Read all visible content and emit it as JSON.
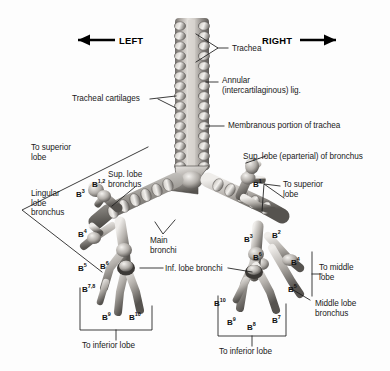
{
  "figure": {
    "orientation": {
      "left_label": "LEFT",
      "left_icon": "arrow-left-icon",
      "right_label": "RIGHT",
      "right_icon": "arrow-right-icon"
    },
    "colors": {
      "background": "#fdfdfd",
      "line": "#1a1a1a",
      "specimen_light": "#e9e7e4",
      "specimen_mid": "#a9a5a1",
      "specimen_dark": "#4e4b48",
      "text": "#1a1a1a"
    },
    "labels": [
      {
        "id": "trachea",
        "text": "Trachea"
      },
      {
        "id": "annular-lig",
        "text": "Annular\n(intercartilaginous) lig."
      },
      {
        "id": "tracheal-cartilages",
        "text": "Tracheal cartilages"
      },
      {
        "id": "membranous-portion",
        "text": "Membranous portion of trachea"
      },
      {
        "id": "sup-lobe-eparterial",
        "text": "Sup. lobe (eparterial) of bronchus"
      },
      {
        "id": "to-superior-lobe-left",
        "text": "To superior\nlobe"
      },
      {
        "id": "lingular-lobe-bronchus",
        "text": "Lingular\nlobe\nbronchus"
      },
      {
        "id": "sup-lobe-bronchus",
        "text": "Sup. lobe\nbronchus"
      },
      {
        "id": "main-bronchi",
        "text": "Main\nbronchi"
      },
      {
        "id": "inf-lobe-bronchi",
        "text": "Inf. lobe bronchi"
      },
      {
        "id": "to-superior-lobe-right",
        "text": "To superior\nlobe"
      },
      {
        "id": "to-middle-lobe",
        "text": "To middle\nlobe"
      },
      {
        "id": "middle-lobe-bronchus",
        "text": "Middle lobe\nbronchus"
      },
      {
        "id": "to-inferior-lobe-left",
        "text": "To inferior lobe"
      },
      {
        "id": "to-inferior-lobe-right",
        "text": "To inferior lobe"
      }
    ],
    "segments_left": [
      {
        "id": "left-b12",
        "base": "B",
        "sup": "1,2"
      },
      {
        "id": "left-b3",
        "base": "B",
        "sup": "3"
      },
      {
        "id": "left-b4",
        "base": "B",
        "sup": "4"
      },
      {
        "id": "left-b5",
        "base": "B",
        "sup": "5"
      },
      {
        "id": "left-b6",
        "base": "B",
        "sup": "6"
      },
      {
        "id": "left-b78",
        "base": "B",
        "sup": "7,8"
      },
      {
        "id": "left-b9",
        "base": "B",
        "sup": "9"
      },
      {
        "id": "left-b10",
        "base": "B",
        "sup": "10"
      }
    ],
    "segments_right": [
      {
        "id": "right-b1",
        "base": "B",
        "sup": "1"
      },
      {
        "id": "right-b2",
        "base": "B",
        "sup": "2"
      },
      {
        "id": "right-b3",
        "base": "B",
        "sup": "3"
      },
      {
        "id": "right-b4",
        "base": "B",
        "sup": "4"
      },
      {
        "id": "right-b5",
        "base": "B",
        "sup": "5"
      },
      {
        "id": "right-b6",
        "base": "B",
        "sup": "6"
      },
      {
        "id": "right-b7",
        "base": "B",
        "sup": "7"
      },
      {
        "id": "right-b8",
        "base": "B",
        "sup": "8"
      },
      {
        "id": "right-b9",
        "base": "B",
        "sup": "9"
      },
      {
        "id": "right-b10",
        "base": "B",
        "sup": "10"
      }
    ]
  }
}
